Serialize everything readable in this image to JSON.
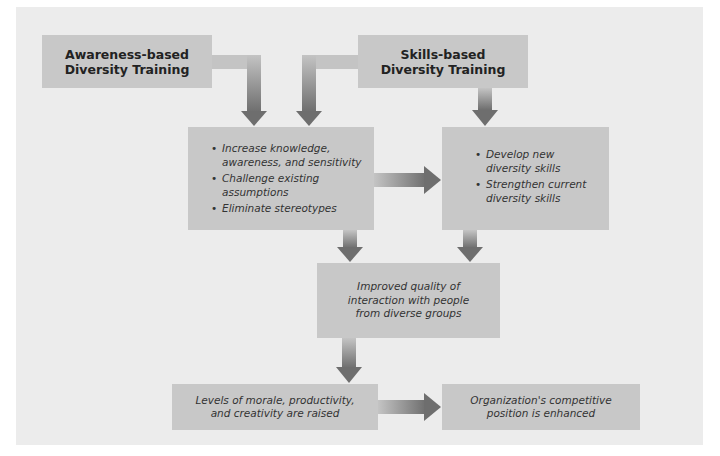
{
  "diagram": {
    "colors": {
      "background": "#ececec",
      "box": "#c8c8c8",
      "arrow_light": "#c4c4c4",
      "arrow_dark": "#6e6e6e",
      "text": "#2a2a2a"
    },
    "nodes": {
      "awareness_training": {
        "line1": "Awareness-based",
        "line2": "Diversity Training"
      },
      "skills_training": {
        "line1": "Skills-based",
        "line2": "Diversity Training"
      },
      "awareness_outcomes": {
        "items": [
          "Increase knowledge, awareness, and sensitivity",
          "Challenge existing assumptions",
          "Eliminate stereotypes"
        ]
      },
      "skills_outcomes": {
        "items": [
          "Develop new diversity skills",
          "Strengthen current diversity skills"
        ]
      },
      "improved_interaction": {
        "text": "Improved quality of interaction with people from diverse groups"
      },
      "morale_raised": {
        "text": "Levels of morale, productivity, and creativity are raised"
      },
      "competitive_position": {
        "text": "Organization's competitive position is enhanced"
      }
    },
    "edges": [
      {
        "from": "awareness_training",
        "to": "awareness_outcomes"
      },
      {
        "from": "skills_training",
        "to": "awareness_outcomes"
      },
      {
        "from": "skills_training",
        "to": "skills_outcomes"
      },
      {
        "from": "awareness_outcomes",
        "to": "skills_outcomes"
      },
      {
        "from": "awareness_outcomes",
        "to": "improved_interaction"
      },
      {
        "from": "skills_outcomes",
        "to": "improved_interaction"
      },
      {
        "from": "improved_interaction",
        "to": "morale_raised"
      },
      {
        "from": "morale_raised",
        "to": "competitive_position"
      }
    ]
  }
}
